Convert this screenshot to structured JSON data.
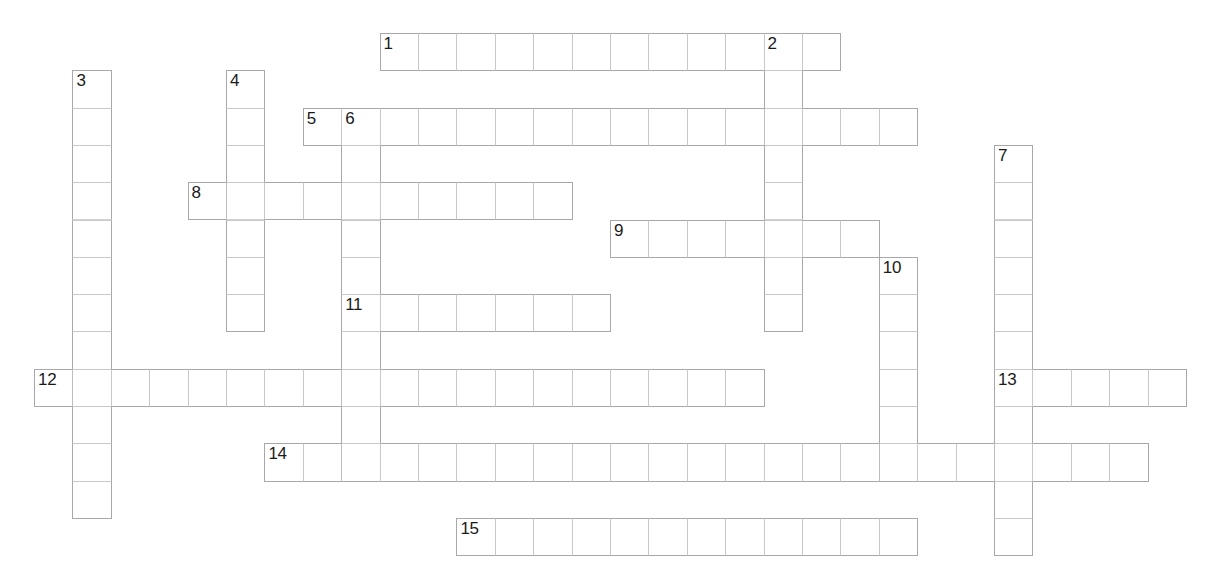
{
  "puzzle": {
    "type": "crossword-grid",
    "title": "",
    "cell_width": 38.4,
    "cell_height": 37.3,
    "origin_x": 34,
    "origin_y": 33,
    "grid_line_color": "#c8c8c8",
    "cell_fill_color": "#ffffff",
    "number_color": "#1a1a1a",
    "background_color": "#ffffff",
    "entries": [
      {
        "number": "1",
        "direction": "across",
        "col": 9,
        "row": 0,
        "length": 12
      },
      {
        "number": "2",
        "direction": "down",
        "col": 19,
        "row": 0,
        "length": 8
      },
      {
        "number": "3",
        "direction": "down",
        "col": 1,
        "row": 1,
        "length": 12
      },
      {
        "number": "4",
        "direction": "down",
        "col": 5,
        "row": 1,
        "length": 7
      },
      {
        "number": "5",
        "direction": "across",
        "col": 7,
        "row": 2,
        "length": 16
      },
      {
        "number": "6",
        "direction": "down",
        "col": 8,
        "row": 2,
        "length": 10
      },
      {
        "number": "7",
        "direction": "down",
        "col": 25,
        "row": 3,
        "length": 11
      },
      {
        "number": "8",
        "direction": "across",
        "col": 4,
        "row": 4,
        "length": 10
      },
      {
        "number": "9",
        "direction": "across",
        "col": 15,
        "row": 5,
        "length": 7
      },
      {
        "number": "10",
        "direction": "down",
        "col": 22,
        "row": 6,
        "length": 6
      },
      {
        "number": "11",
        "direction": "across",
        "col": 8,
        "row": 7,
        "length": 7
      },
      {
        "number": "12",
        "direction": "across",
        "col": 0,
        "row": 9,
        "length": 19
      },
      {
        "number": "13",
        "direction": "across",
        "col": 25,
        "row": 9,
        "length": 5
      },
      {
        "number": "14",
        "direction": "across",
        "col": 6,
        "row": 11,
        "length": 23
      },
      {
        "number": "15",
        "direction": "across",
        "col": 11,
        "row": 13,
        "length": 12
      }
    ]
  }
}
